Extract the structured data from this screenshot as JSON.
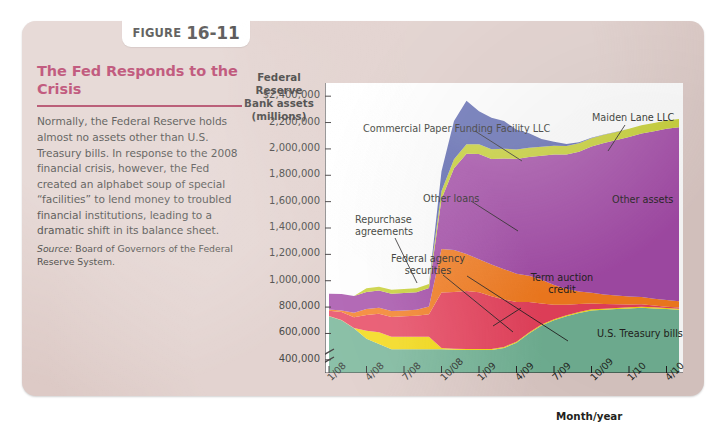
{
  "figure": {
    "label_word": "FIGURE",
    "number": "16-11",
    "title": "The Fed Responds to the Crisis",
    "body": "Normally, the Federal Reserve holds almost no assets other than U.S. Treasury bills. In response to the 2008 financial crisis, however, the Fed created an alphabet soup of special “facilities” to lend money to troubled financial institutions, leading to a dramatic shift in its balance sheet.",
    "source_label": "Source:",
    "source_text": "Board of Governors of the Federal Reserve System."
  },
  "colors": {
    "card_bg": "#ddcac6",
    "title_red": "#a8164a",
    "plot_bg": "#ffffff",
    "treasury_green": "#72b395",
    "agency_yellow": "#f5d90a",
    "term_auction_red": "#e8415c",
    "other_loans_orange": "#f57c1f",
    "other_assets_purple": "#a44ba8",
    "maiden_lane_olive": "#c8d130",
    "cpff_blue": "#5b66b0"
  },
  "chart_data": {
    "type": "area",
    "stacked": true,
    "title": "",
    "ylabel": "Federal Reserve Bank assets (millions)",
    "xlabel": "Month/year",
    "grid": false,
    "legend": "annotations-in-plot",
    "ylim": [
      300000,
      2500000
    ],
    "axis_break": true,
    "ytick_labels": [
      "$2,400,000",
      "2,200,000",
      "2,000,000",
      "1,800,000",
      "1,600,000",
      "1,400,000",
      "1,200,000",
      "1,000,000",
      "800,000",
      "600,000",
      "400,000"
    ],
    "ytick_values": [
      2400000,
      2200000,
      2000000,
      1800000,
      1600000,
      1400000,
      1200000,
      1000000,
      800000,
      600000,
      400000
    ],
    "categories": [
      "1/08",
      "2/08",
      "3/08",
      "4/08",
      "5/08",
      "6/08",
      "7/08",
      "8/08",
      "9/08",
      "10/08",
      "11/08",
      "12/08",
      "1/09",
      "2/09",
      "3/09",
      "4/09",
      "5/09",
      "6/09",
      "7/09",
      "8/09",
      "9/09",
      "10/09",
      "11/09",
      "12/09",
      "1/10",
      "2/10",
      "3/10",
      "4/10",
      "5/10"
    ],
    "xtick_labels": [
      "1/08",
      "4/08",
      "7/08",
      "10/08",
      "1/09",
      "4/09",
      "7/09",
      "10/09",
      "1/10",
      "4/10"
    ],
    "xtick_indices": [
      0,
      3,
      6,
      9,
      12,
      15,
      18,
      21,
      24,
      27
    ],
    "series": [
      {
        "name": "U.S. Treasury bills",
        "color": "#72b395",
        "values": [
          730000,
          700000,
          640000,
          560000,
          520000,
          480000,
          480000,
          480000,
          480000,
          480000,
          476000,
          475000,
          474000,
          475000,
          490000,
          530000,
          600000,
          660000,
          700000,
          730000,
          755000,
          775000,
          780000,
          785000,
          790000,
          795000,
          790000,
          785000,
          780000
        ]
      },
      {
        "name": "Federal agency securities",
        "color": "#f5d90a",
        "values": [
          2000,
          2000,
          2000,
          60000,
          90000,
          95000,
          95000,
          95000,
          95000,
          10000,
          8000,
          8000,
          8000,
          8000,
          8000,
          8000,
          8000,
          8000,
          8000,
          8000,
          8000,
          8000,
          8000,
          8000,
          8000,
          8000,
          8000,
          8000,
          8000
        ]
      },
      {
        "name": "Term auction credit",
        "color": "#e8415c",
        "values": [
          40000,
          60000,
          80000,
          120000,
          140000,
          150000,
          155000,
          160000,
          170000,
          420000,
          430000,
          440000,
          430000,
          400000,
          360000,
          300000,
          230000,
          160000,
          110000,
          80000,
          60000,
          45000,
          35000,
          28000,
          22000,
          18000,
          14000,
          10000,
          8000
        ]
      },
      {
        "name": "Other loans",
        "color": "#f57c1f",
        "values": [
          10000,
          12000,
          35000,
          45000,
          45000,
          45000,
          45000,
          45000,
          60000,
          330000,
          320000,
          280000,
          250000,
          240000,
          230000,
          215000,
          200000,
          180000,
          150000,
          120000,
          95000,
          80000,
          72000,
          66000,
          60000,
          56000,
          52000,
          50000,
          48000
        ]
      },
      {
        "name": "Other assets",
        "color": "#a44ba8",
        "values": [
          120000,
          125000,
          128000,
          130000,
          130000,
          132000,
          132000,
          132000,
          140000,
          380000,
          620000,
          760000,
          800000,
          800000,
          840000,
          870000,
          900000,
          940000,
          990000,
          1020000,
          1060000,
          1110000,
          1150000,
          1180000,
          1210000,
          1240000,
          1270000,
          1300000,
          1320000
        ]
      },
      {
        "name": "Maiden Lane LLC",
        "color": "#c8d130",
        "values": [
          0,
          0,
          0,
          28000,
          30000,
          30000,
          30000,
          30000,
          30000,
          60000,
          68000,
          72000,
          74000,
          74000,
          74000,
          72000,
          70000,
          68000,
          66000,
          64000,
          64000,
          62000,
          62000,
          62000,
          62000,
          62000,
          62000,
          62000,
          62000
        ]
      },
      {
        "name": "Commercial Paper Funding Facility LLC",
        "color": "#5b66b0",
        "values": [
          0,
          0,
          0,
          0,
          0,
          0,
          0,
          0,
          0,
          150000,
          290000,
          330000,
          250000,
          240000,
          210000,
          150000,
          110000,
          60000,
          30000,
          15000,
          8000,
          4000,
          2000,
          1000,
          1000,
          1000,
          1000,
          1000,
          1000
        ]
      }
    ],
    "annotations": [
      {
        "text": "Commercial Paper Funding Facility LLC",
        "name": "annotation-cpff"
      },
      {
        "text": "Maiden Lane LLC",
        "name": "annotation-maiden-lane"
      },
      {
        "text": "Other assets",
        "name": "annotation-other-assets"
      },
      {
        "text": "Other loans",
        "name": "annotation-other-loans"
      },
      {
        "text": "Repurchase agreements",
        "name": "annotation-repurchase-agreements"
      },
      {
        "text": "Federal agency securities",
        "name": "annotation-federal-agency-securities"
      },
      {
        "text": "Term auction credit",
        "name": "annotation-term-auction-credit"
      },
      {
        "text": "U.S. Treasury bills",
        "name": "annotation-us-treasury-bills"
      }
    ]
  }
}
